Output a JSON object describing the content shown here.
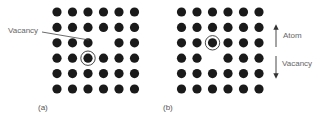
{
  "diagram": {
    "colors": {
      "atom": "#1a1a1a",
      "ring": "#333333",
      "text": "#666666",
      "leader_line": "#444444",
      "background": "#ffffff"
    },
    "grid": {
      "rows": 6,
      "cols": 6
    },
    "panels": [
      {
        "id": "a",
        "label": "(a)",
        "vacancy": {
          "row": 3,
          "col": 4
        },
        "circled_atom": {
          "row": 4,
          "col": 3
        },
        "annotation": "Vacancy"
      },
      {
        "id": "b",
        "label": "(b)",
        "vacancy": {
          "row": 4,
          "col": 3
        },
        "circled_atom": {
          "row": 3,
          "col": 3
        }
      }
    ],
    "legend": {
      "up_arrow_label": "Atom",
      "down_arrow_label": "Vacancy"
    }
  }
}
